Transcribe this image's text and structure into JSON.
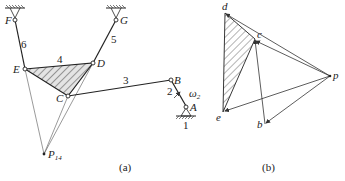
{
  "figure_a": {
    "caption": "(a)",
    "joints": {
      "F": "F",
      "G": "G",
      "E": "E",
      "D": "D",
      "C": "C",
      "B": "B",
      "A": "A"
    },
    "links": {
      "l1": "1",
      "l2": "2",
      "l3": "3",
      "l4": "4",
      "l5": "5",
      "l6": "6"
    },
    "omega": "ω",
    "omega_sub": "2",
    "instant_center": "P",
    "instant_center_sub": "14"
  },
  "figure_b": {
    "caption": "(b)",
    "points": {
      "p": "p",
      "b": "b",
      "c": "c",
      "d": "d",
      "e": "e"
    }
  },
  "colors": {
    "line": "#222222",
    "hatch": "#555555",
    "fill": "#d8d8d8"
  }
}
